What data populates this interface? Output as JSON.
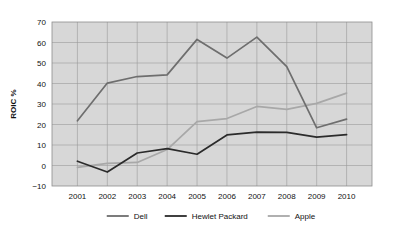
{
  "chart_data": {
    "type": "line",
    "title": "",
    "subtitle": "",
    "xlabel": "",
    "ylabel": "ROIC %",
    "categories": [
      "2001",
      "2002",
      "2003",
      "2004",
      "2005",
      "2006",
      "2007",
      "2008",
      "2009",
      "2010"
    ],
    "x": [
      2001,
      2002,
      2003,
      2004,
      2005,
      2006,
      2007,
      2008,
      2009,
      2010
    ],
    "xlim": [
      2000.6,
      2010.6
    ],
    "ylim": [
      -10,
      70
    ],
    "yticks": [
      -10,
      0,
      10,
      20,
      30,
      40,
      50,
      60,
      70
    ],
    "ytick_labels": [
      "−10",
      "0",
      "10",
      "20",
      "30",
      "40",
      "50",
      "60",
      "70"
    ],
    "grid": true,
    "legend_position": "bottom",
    "series": [
      {
        "name": "Dell",
        "color": "#6e6e6e",
        "values": [
          21.8,
          40.2,
          43.4,
          44.2,
          61.5,
          52.4,
          62.6,
          48.2,
          18.4,
          22.6
        ]
      },
      {
        "name": "Hewlet Packard",
        "color": "#2b2b2b",
        "values": [
          2.1,
          -3.2,
          6.1,
          8.2,
          5.5,
          14.9,
          16.3,
          16.2,
          13.8,
          15.1
        ]
      },
      {
        "name": "Apple",
        "color": "#a8a8a8",
        "values": [
          -0.9,
          1.0,
          1.5,
          7.8,
          21.4,
          22.9,
          28.8,
          27.4,
          30.3,
          35.3
        ]
      }
    ]
  },
  "axes": {
    "y_axis_title": "ROIC %"
  },
  "legend": {
    "items": [
      {
        "label": "Dell",
        "color": "#6e6e6e"
      },
      {
        "label": "Hewlet Packard",
        "color": "#2b2b2b"
      },
      {
        "label": "Apple",
        "color": "#a8a8a8"
      }
    ]
  },
  "colors": {
    "plot_background": "#d7d7d7",
    "gridline": "#9a9a9a",
    "page_background": "#ffffff",
    "text": "#111111"
  }
}
